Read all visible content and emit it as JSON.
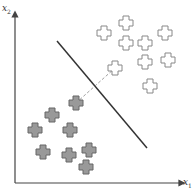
{
  "axes": {
    "y_label": "x",
    "y_label_sub": "2",
    "x_label": "x",
    "x_label_sub": "1"
  },
  "colors": {
    "axis": "#444444",
    "boundary": "#333333",
    "margin_line": "#888888",
    "open_fill": "#ffffff",
    "open_stroke": "#888888",
    "filled_fill": "#999999",
    "filled_stroke": "#666666"
  },
  "boundary": {
    "x1": 57,
    "y1": 41,
    "x2": 147,
    "y2": 148
  },
  "margin": {
    "x1": 76,
    "y1": 103,
    "x2": 115,
    "y2": 68
  },
  "open_points": [
    [
      104,
      33
    ],
    [
      126,
      23
    ],
    [
      126,
      43
    ],
    [
      145,
      43
    ],
    [
      165,
      33
    ],
    [
      145,
      62
    ],
    [
      168,
      60
    ],
    [
      115,
      68
    ],
    [
      150,
      86
    ]
  ],
  "filled_points": [
    [
      76,
      103
    ],
    [
      52,
      115
    ],
    [
      35,
      130
    ],
    [
      70,
      130
    ],
    [
      43,
      152
    ],
    [
      69,
      155
    ],
    [
      89,
      150
    ],
    [
      86,
      167
    ]
  ]
}
